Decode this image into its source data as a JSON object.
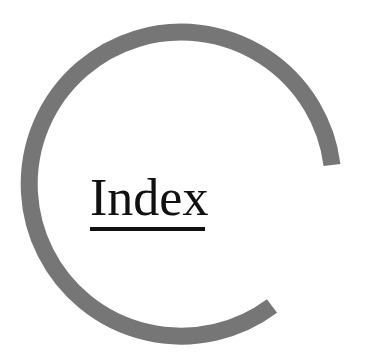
{
  "page": {
    "title": "Index",
    "colors": {
      "ring": "#767676",
      "text": "#111111",
      "background": "#ffffff"
    }
  }
}
